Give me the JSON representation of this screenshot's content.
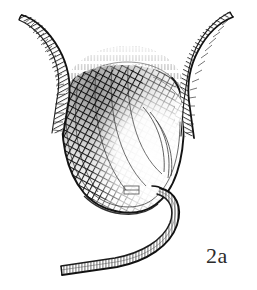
{
  "figure": {
    "label": "2a",
    "background_color": "#ffffff",
    "ink_color": "#1a1a1a",
    "style": "engraving cross-hatch line art",
    "parts": {
      "sac": {
        "name": "cross-hatched sac",
        "shading": "dense diagonal cross-hatching, dark upper-left, light highlight right"
      },
      "left_horn": {
        "name": "left hatched horn",
        "shading": "parallel hatch bands along curved band"
      },
      "right_horn": {
        "name": "right hatched horn",
        "shading": "parallel hatch bands along curved band"
      },
      "dome": {
        "name": "upper dome",
        "shading": "fine vertical stipple strokes"
      },
      "tube": {
        "name": "catheter tube",
        "shading": "fine transverse tick hatching along tube"
      },
      "inset_mark": {
        "name": "small rectangular mark"
      }
    }
  }
}
